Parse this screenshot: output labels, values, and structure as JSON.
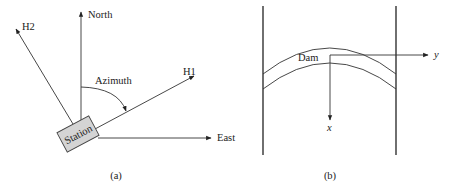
{
  "figure": {
    "panel_a": {
      "caption": "(a)",
      "labels": {
        "north": "North",
        "east": "East",
        "h1": "H1",
        "h2": "H2",
        "azimuth": "Azimuth",
        "station": "Station"
      },
      "colors": {
        "station_fill": "#d4d4d4",
        "line": "#333333"
      }
    },
    "panel_b": {
      "caption": "(b)",
      "labels": {
        "dam": "Dam",
        "x_axis": "x",
        "y_axis": "y"
      }
    }
  }
}
